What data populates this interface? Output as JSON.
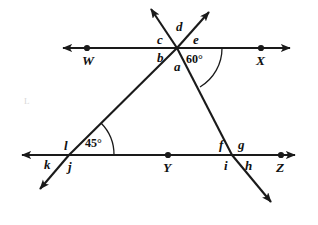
{
  "figure": {
    "background_color": "#ffffff",
    "stroke_color": "#1a1a1a",
    "lines": [
      {
        "name": "line-WX",
        "label_left": "W",
        "label_right": "X",
        "orientation": "horizontal",
        "arrows": "both"
      },
      {
        "name": "line-kZ",
        "label_left": "k",
        "label_right": "Z",
        "orientation": "horizontal",
        "arrows": "both"
      },
      {
        "name": "transversal-left",
        "orientation": "diagonal",
        "arrows": "both"
      },
      {
        "name": "transversal-right",
        "orientation": "diagonal",
        "arrows": "both"
      }
    ],
    "points": [
      {
        "name": "point-W",
        "label": "W"
      },
      {
        "name": "point-X",
        "label": "X"
      },
      {
        "name": "point-Y",
        "label": "Y"
      },
      {
        "name": "point-Z",
        "label": "Z"
      }
    ],
    "angle_labels": [
      {
        "name": "angle-a",
        "label": "a"
      },
      {
        "name": "angle-b",
        "label": "b"
      },
      {
        "name": "angle-c",
        "label": "c"
      },
      {
        "name": "angle-d",
        "label": "d"
      },
      {
        "name": "angle-e",
        "label": "e"
      },
      {
        "name": "angle-f",
        "label": "f"
      },
      {
        "name": "angle-g",
        "label": "g"
      },
      {
        "name": "angle-h",
        "label": "h"
      },
      {
        "name": "angle-i",
        "label": "i"
      },
      {
        "name": "angle-j",
        "label": "j"
      },
      {
        "name": "angle-k",
        "label": "k"
      },
      {
        "name": "angle-l",
        "label": "l"
      }
    ],
    "measured_angles": [
      {
        "name": "angle-measure-60",
        "label": "60°",
        "vertex": "top-intersection"
      },
      {
        "name": "angle-measure-45",
        "label": "45°",
        "vertex": "bottom-left-intersection"
      }
    ],
    "artifact": {
      "name": "scan-smudge",
      "label": "L"
    }
  }
}
